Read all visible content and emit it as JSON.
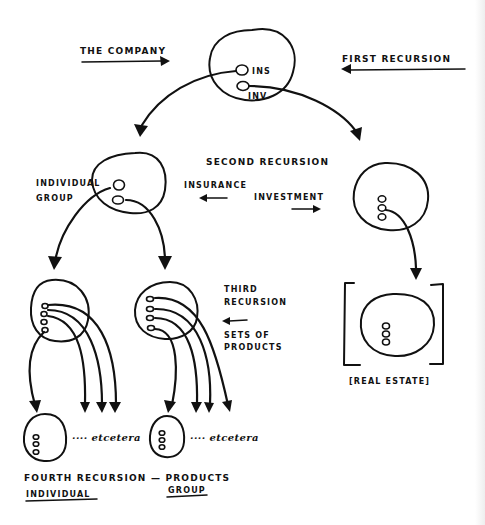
{
  "diagram": {
    "labels": {
      "the_company": "THE COMPANY",
      "first_recursion": "FIRST RECURSION",
      "ins": "INS",
      "inv": "INV",
      "individual": "INDIVIDUAL",
      "group": "GROUP",
      "second_recursion": "SECOND RECURSION",
      "insurance": "INSURANCE",
      "investment": "INVESTMENT",
      "third_recursion_line1": "THIRD",
      "third_recursion_line2": "RECURSION",
      "sets_of_products_line1": "SETS OF",
      "sets_of_products_line2": "PRODUCTS",
      "real_estate": "[REAL ESTATE]",
      "etcetera_left": "···· etcetera",
      "etcetera_right": "···· etcetera",
      "fourth_recursion": "FOURTH RECURSION — PRODUCTS",
      "individual_bottom": "INDIVIDUAL",
      "group_bottom": "GROUP"
    },
    "nodes": [
      {
        "id": "company",
        "level": 0,
        "children": [
          "insurance",
          "investment"
        ]
      },
      {
        "id": "insurance",
        "level": 1,
        "children": [
          "individual-products",
          "group-products"
        ]
      },
      {
        "id": "investment",
        "level": 1,
        "children": [
          "real-estate"
        ]
      },
      {
        "id": "individual-products",
        "level": 2,
        "dots": 4
      },
      {
        "id": "group-products",
        "level": 2,
        "dots": 4
      },
      {
        "id": "real-estate",
        "level": 2,
        "dots": 3
      },
      {
        "id": "individual-product",
        "level": 3,
        "dots": 3
      },
      {
        "id": "group-product",
        "level": 3,
        "dots": 3
      }
    ],
    "colors": {
      "ink": "#111111",
      "paper": "#ffffff"
    }
  }
}
